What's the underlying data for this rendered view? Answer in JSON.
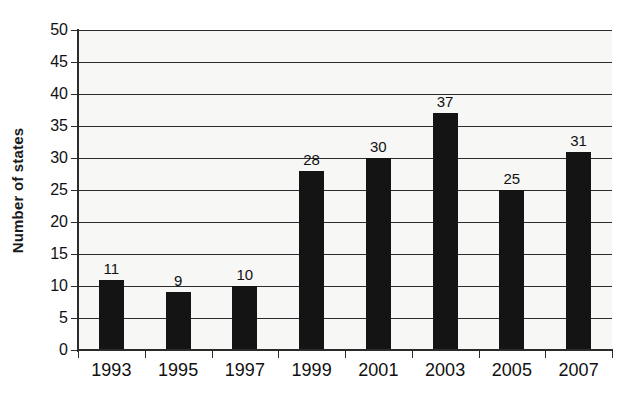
{
  "chart_data": {
    "type": "bar",
    "title": "",
    "xlabel": "",
    "ylabel": "Number of states",
    "categories": [
      "1993",
      "1995",
      "1997",
      "1999",
      "2001",
      "2003",
      "2005",
      "2007"
    ],
    "values": [
      11,
      9,
      10,
      28,
      30,
      37,
      25,
      31
    ],
    "value_labels": [
      "11",
      "9",
      "10",
      "28",
      "30",
      "37",
      "25",
      "31"
    ],
    "ylim": [
      0,
      50
    ],
    "ytick_labels": [
      "0",
      "5",
      "10",
      "15",
      "20",
      "25",
      "30",
      "35",
      "40",
      "45",
      "50"
    ],
    "ytick_values": [
      0,
      5,
      10,
      15,
      20,
      25,
      30,
      35,
      40,
      45,
      50
    ],
    "grid": true,
    "legend": "none",
    "bar_color": "#141414",
    "plot_background": "#f7f7f5",
    "axis_color": "#2b2b2b",
    "text_color": "#111111"
  }
}
